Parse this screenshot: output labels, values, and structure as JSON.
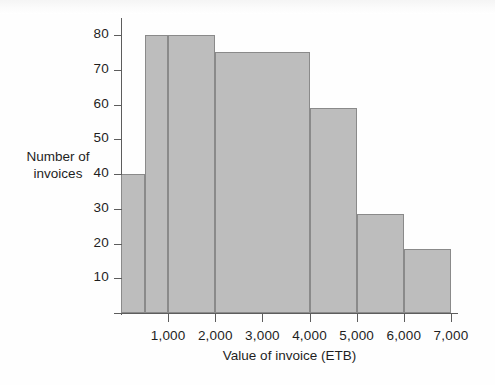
{
  "chart_data": {
    "type": "bar",
    "title": "",
    "xlabel": "Value of invoice (ETB)",
    "ylabel_line1": "Number of",
    "ylabel_line2": "invoices",
    "ylabel": "Number of invoices",
    "xlim": [
      0,
      7000
    ],
    "ylim": [
      0,
      85
    ],
    "grid": false,
    "legend": null,
    "bar_color": "#bdbdbd",
    "bar_edge_color": "#8a8a8a",
    "axis_color": "#5d5d5d",
    "xtick_labels": [
      "1,000",
      "2,000",
      "3,000",
      "4,000",
      "5,000",
      "6,000",
      "7,000"
    ],
    "xtick_values": [
      1000,
      2000,
      3000,
      4000,
      5000,
      6000,
      7000
    ],
    "ytick_labels": [
      "10",
      "20",
      "30",
      "40",
      "50",
      "60",
      "70",
      "80"
    ],
    "ytick_values": [
      10,
      20,
      30,
      40,
      50,
      60,
      70,
      80
    ],
    "bins": [
      {
        "label": "0-500",
        "x_start": 0,
        "x_end": 500,
        "value": 40
      },
      {
        "label": "500-1,000",
        "x_start": 500,
        "x_end": 1000,
        "value": 80
      },
      {
        "label": "1,000-2,000",
        "x_start": 1000,
        "x_end": 2000,
        "value": 80
      },
      {
        "label": "2,000-4,000",
        "x_start": 2000,
        "x_end": 4000,
        "value": 75
      },
      {
        "label": "4,000-5,000",
        "x_start": 4000,
        "x_end": 5000,
        "value": 59
      },
      {
        "label": "5,000-6,000",
        "x_start": 5000,
        "x_end": 6000,
        "value": 28.5
      },
      {
        "label": "6,000-7,000",
        "x_start": 6000,
        "x_end": 7000,
        "value": 18.5
      }
    ]
  }
}
